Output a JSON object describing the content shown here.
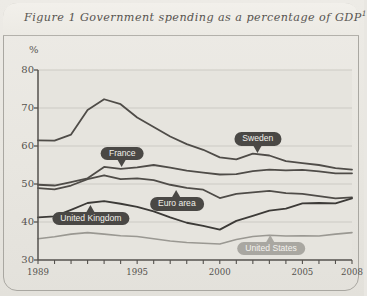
{
  "figure": {
    "title_text": "Figure 1 Government spending as a percentage of GDP",
    "title_superscript": "1"
  },
  "chart_data": {
    "type": "line",
    "title": "Figure 1 Government spending as a percentage of GDP",
    "xlabel": "",
    "ylabel": "%",
    "ylim": [
      30,
      80
    ],
    "xlim": [
      1989,
      2008
    ],
    "yticks": [
      30,
      40,
      50,
      60,
      70,
      80
    ],
    "xticks": [
      1989,
      1990,
      1991,
      1992,
      1993,
      1994,
      1995,
      1996,
      1997,
      1998,
      1999,
      2000,
      2001,
      2002,
      2003,
      2004,
      2005,
      2006,
      2007,
      2008
    ],
    "xtick_labels": [
      "1989",
      "1995",
      "2000",
      "2005",
      "2008"
    ],
    "xtick_label_values": [
      1989,
      1995,
      2000,
      2005,
      2008
    ],
    "grid": true,
    "legend": "inline-callouts",
    "x": [
      1989,
      1990,
      1991,
      1992,
      1993,
      1994,
      1995,
      1996,
      1997,
      1998,
      1999,
      2000,
      2001,
      2002,
      2003,
      2004,
      2005,
      2006,
      2007,
      2008
    ],
    "series": [
      {
        "name": "Sweden",
        "color": "#4f4c48",
        "width": 1.8,
        "values": [
          61.5,
          61.4,
          63.0,
          69.5,
          72.3,
          71.0,
          67.5,
          65.0,
          62.5,
          60.5,
          59.0,
          57.0,
          56.5,
          58.0,
          57.5,
          56.0,
          55.5,
          55.0,
          54.2,
          53.8
        ]
      },
      {
        "name": "France",
        "color": "#4f4c48",
        "width": 1.8,
        "values": [
          49.8,
          49.6,
          50.5,
          51.5,
          54.5,
          54.0,
          54.4,
          55.0,
          54.3,
          53.5,
          53.0,
          52.5,
          52.6,
          53.4,
          53.8,
          53.6,
          53.7,
          53.3,
          52.8,
          52.8
        ]
      },
      {
        "name": "Euro area",
        "color": "#4f4c48",
        "width": 1.8,
        "values": [
          48.9,
          48.6,
          49.6,
          51.3,
          52.3,
          51.3,
          51.5,
          51.0,
          49.8,
          49.0,
          48.5,
          46.3,
          47.4,
          47.8,
          48.2,
          47.6,
          47.4,
          46.8,
          46.2,
          46.5
        ]
      },
      {
        "name": "United Kingdom",
        "color": "#3c3a37",
        "width": 1.8,
        "values": [
          41.2,
          41.5,
          43.2,
          45.0,
          45.5,
          44.8,
          44.0,
          42.8,
          41.2,
          39.8,
          39.0,
          38.0,
          40.3,
          41.6,
          43.0,
          43.5,
          44.9,
          45.0,
          44.9,
          46.2
        ]
      },
      {
        "name": "United States",
        "color": "#9a9892",
        "width": 1.6,
        "values": [
          35.6,
          36.1,
          36.8,
          37.2,
          36.8,
          36.4,
          36.2,
          35.6,
          35.0,
          34.6,
          34.4,
          34.2,
          35.4,
          36.2,
          36.5,
          36.3,
          36.4,
          36.3,
          36.8,
          37.2
        ]
      }
    ],
    "annotations": [
      {
        "label": "France",
        "x": 1994.1,
        "y": 58.2,
        "style": "dark",
        "pointer": "down"
      },
      {
        "label": "Sweden",
        "x": 2002.3,
        "y": 62.1,
        "style": "dark",
        "pointer": "down"
      },
      {
        "label": "Euro area",
        "x": 1997.4,
        "y": 44.9,
        "style": "dark",
        "pointer": "up"
      },
      {
        "label": "United Kingdom",
        "x": 1992.2,
        "y": 41.1,
        "style": "dark",
        "pointer": "up"
      },
      {
        "label": "United States",
        "x": 2003.1,
        "y": 33.2,
        "style": "light",
        "pointer": "up"
      }
    ]
  }
}
